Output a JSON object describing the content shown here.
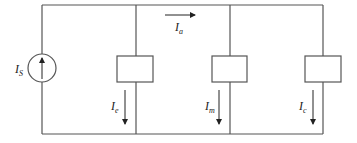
{
  "diagram": {
    "source": {
      "label": "I",
      "subscript": "S",
      "type": "current-source",
      "direction": "up"
    },
    "top_current": {
      "label": "I",
      "subscript": "a",
      "direction": "right"
    },
    "branches": [
      {
        "id": "e",
        "label": "I",
        "subscript": "e",
        "direction": "down"
      },
      {
        "id": "m",
        "label": "I",
        "subscript": "m",
        "direction": "down"
      },
      {
        "id": "c",
        "label": "I",
        "subscript": "c",
        "direction": "down"
      }
    ],
    "colors": {
      "wire": "#555555",
      "text": "#222222",
      "background": "#ffffff"
    }
  }
}
